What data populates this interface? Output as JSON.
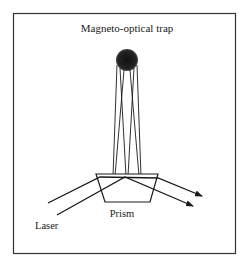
{
  "diagram": {
    "title": "Magneto-optical trap",
    "labels": {
      "laser": "Laser",
      "prism": "Prism"
    },
    "components": [
      "magneto-optical-trap",
      "laser-beams",
      "prism"
    ],
    "colors": {
      "ink": "#1a1a1a",
      "background": "#ffffff",
      "frame": "#333333"
    }
  }
}
